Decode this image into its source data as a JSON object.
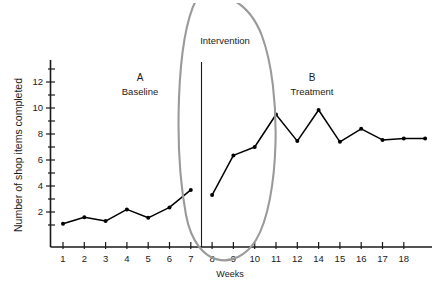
{
  "chart_data": {
    "type": "line",
    "title": "",
    "xlabel": "Weeks",
    "ylabel": "Number of shop items completed",
    "xlim": [
      0.3,
      18.7
    ],
    "ylim": [
      0,
      13
    ],
    "grid": false,
    "legend_position": "none",
    "x_tick_labels": [
      "1",
      "2",
      "3",
      "4",
      "5",
      "6",
      "7",
      "8",
      "9",
      "10",
      "11",
      "12",
      "14",
      "15",
      "16",
      "17",
      "18"
    ],
    "y_tick_labels": [
      "2",
      "4",
      "6",
      "8",
      "10",
      "12"
    ],
    "y_tick_values": [
      2,
      4,
      6,
      8,
      10,
      12
    ],
    "y_minor_tick_values": [
      1,
      3,
      5,
      7,
      9,
      11,
      13
    ],
    "series": [
      {
        "name": "A Baseline",
        "x": [
          1,
          2,
          3,
          4,
          5,
          6,
          7
        ],
        "values": [
          1.1,
          1.6,
          1.3,
          2.2,
          1.55,
          2.35,
          3.7
        ]
      },
      {
        "name": "B Treatment",
        "x": [
          8,
          9,
          10,
          11,
          12,
          13,
          14,
          15,
          16,
          17,
          18
        ],
        "values": [
          3.3,
          6.35,
          7.0,
          9.5,
          7.45,
          9.85,
          7.4,
          8.4,
          7.55,
          7.65,
          7.65
        ]
      }
    ],
    "annotations": [
      {
        "name": "phase-a-letter",
        "text": "A",
        "x": 4.2,
        "y": 12.2
      },
      {
        "name": "phase-a-name",
        "text": "Baseline",
        "x": 4.2,
        "y": 11.3
      },
      {
        "name": "phase-b-letter",
        "text": "B",
        "x": 13.0,
        "y": 12.2
      },
      {
        "name": "phase-b-name",
        "text": "Treatment",
        "x": 13.0,
        "y": 11.3
      },
      {
        "name": "intervention-label",
        "text": "Intervention",
        "x": 7.6,
        "y": 14.4
      }
    ],
    "phase_change_line": {
      "x": 7.5,
      "label": "Intervention"
    },
    "highlight_oval": {
      "shape": "ellipse",
      "color": "#9a9a9a",
      "targets": "intervention phase-change line"
    }
  },
  "axis": {
    "y_title": "Number of shop items completed",
    "x_title": "Weeks"
  },
  "phases": {
    "a": {
      "letter": "A",
      "name": "Baseline"
    },
    "b": {
      "letter": "B",
      "name": "Treatment"
    }
  },
  "intervention": {
    "label": "Intervention"
  },
  "caption": {
    "figure_number": "Fig. 3.5",
    "text": "Example of an A-B time-series intervalized"
  }
}
